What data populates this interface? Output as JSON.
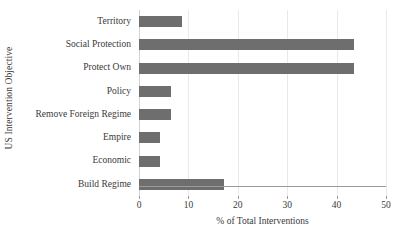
{
  "chart_data": {
    "type": "bar",
    "orientation": "horizontal",
    "title": "",
    "xlabel": "% of Total Interventions",
    "ylabel": "US Intervention Objective",
    "categories": [
      "Territory",
      "Social Protection",
      "Protect Own",
      "Policy",
      "Remove Foreign Regime",
      "Empire",
      "Economic",
      "Build Regime"
    ],
    "values": [
      8.7,
      43.5,
      43.5,
      6.5,
      6.5,
      4.3,
      4.3,
      17.2
    ],
    "xlim": [
      0,
      50
    ],
    "xticks": [
      0,
      10,
      20,
      30,
      40,
      50
    ],
    "xtick_labels": [
      "0",
      "10",
      "20",
      "30",
      "40",
      "50"
    ],
    "grid": "vertical",
    "legend": "none",
    "bar_color": "#6e6e6e",
    "gridline_color": "#e9e9e9",
    "axis_color": "#9a9a9a",
    "text_color": "#3a3a3a"
  }
}
